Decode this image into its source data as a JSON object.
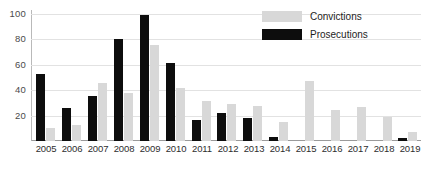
{
  "chart_data": {
    "type": "bar",
    "title": "",
    "subtitle": "",
    "xlabel": "",
    "ylabel": "",
    "categories": [
      "2005",
      "2006",
      "2007",
      "2008",
      "2009",
      "2010",
      "2011",
      "2012",
      "2013",
      "2014",
      "2015",
      "2016",
      "2017",
      "2018",
      "2019"
    ],
    "series": [
      {
        "name": "Prosecutions",
        "color": "#0d0d0d",
        "values": [
          53,
          26,
          36,
          81,
          100,
          62,
          17,
          22,
          18,
          3,
          0,
          0,
          0,
          0,
          2
        ]
      },
      {
        "name": "Convictions",
        "color": "#d8d8d8",
        "values": [
          10,
          13,
          46,
          38,
          76,
          42,
          32,
          29,
          28,
          15,
          48,
          25,
          27,
          19,
          7
        ]
      }
    ],
    "ylim": [
      0,
      100
    ],
    "yticks": [
      20,
      40,
      60,
      80,
      100
    ],
    "ytick_labels": [
      "20",
      "40",
      "60",
      "80",
      "100"
    ],
    "grid": "horizontal",
    "legend_position": "top-right",
    "legend_order": [
      "Convictions",
      "Prosecutions"
    ]
  },
  "legend": {
    "entries": [
      {
        "label": "Convictions",
        "swatch": "convictions-swatch"
      },
      {
        "label": "Prosecutions",
        "swatch": "prosecutions-swatch"
      }
    ]
  },
  "colors": {
    "prosecutions": "#0d0d0d",
    "convictions": "#d8d8d8",
    "gridline": "#e2e2e2",
    "axis": "#9a9a9a",
    "background": "#ffffff",
    "tick_text": "#4a4a4a",
    "label_text": "#2e2e2e"
  }
}
